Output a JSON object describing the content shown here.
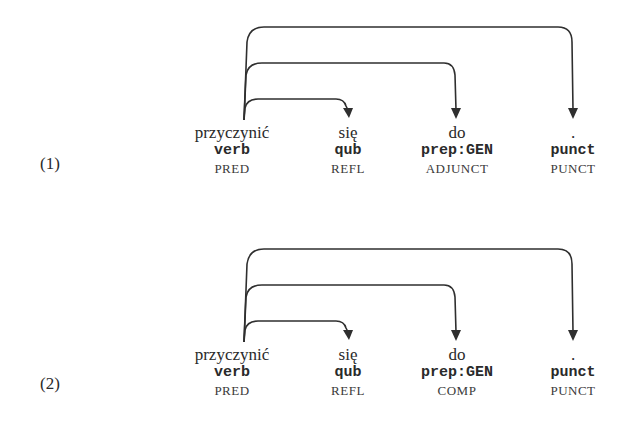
{
  "examples": [
    {
      "number": "(1)",
      "tokens": [
        {
          "word": "przyczynić",
          "tag": "verb",
          "label": "PRED"
        },
        {
          "word": "się",
          "tag": "qub",
          "label": "REFL"
        },
        {
          "word": "do",
          "tag": "prep:GEN",
          "label": "ADJUNCT"
        },
        {
          "word": ".",
          "tag": "punct",
          "label": "PUNCT"
        }
      ],
      "arcs": [
        {
          "from": 0,
          "to": 1
        },
        {
          "from": 0,
          "to": 2
        },
        {
          "from": 0,
          "to": 3
        }
      ]
    },
    {
      "number": "(2)",
      "tokens": [
        {
          "word": "przyczynić",
          "tag": "verb",
          "label": "PRED"
        },
        {
          "word": "się",
          "tag": "qub",
          "label": "REFL"
        },
        {
          "word": "do",
          "tag": "prep:GEN",
          "label": "COMP"
        },
        {
          "word": ".",
          "tag": "punct",
          "label": "PUNCT"
        }
      ],
      "arcs": [
        {
          "from": 0,
          "to": 1
        },
        {
          "from": 0,
          "to": 2
        },
        {
          "from": 0,
          "to": 3
        }
      ]
    }
  ]
}
